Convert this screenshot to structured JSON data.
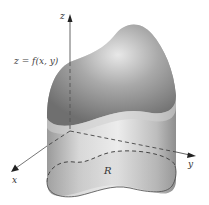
{
  "figure": {
    "labels": {
      "z_axis": "z",
      "x_axis": "x",
      "y_axis": "y",
      "region": "R",
      "surface_lhs": "z",
      "surface_eq_sign": "=",
      "surface_rhs": "f(x, y)"
    },
    "colors": {
      "background": "#ffffff",
      "solid_dark": "#7a7a7a",
      "solid_mid": "#b5b5b5",
      "solid_light": "#e6e6e6",
      "axis": "#555555",
      "dashed": "#444444"
    }
  }
}
